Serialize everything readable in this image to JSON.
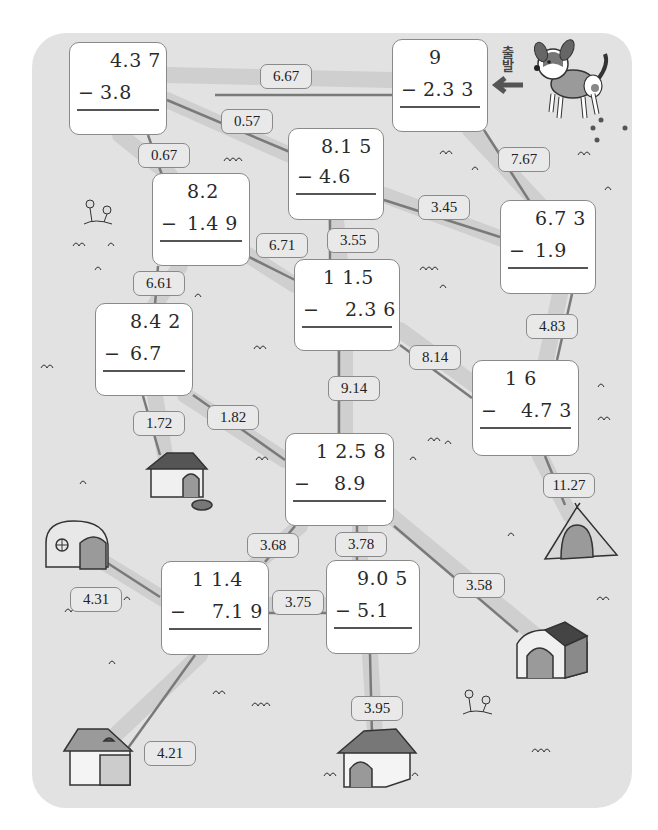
{
  "start_label": "출발",
  "problems": [
    {
      "id": "p1",
      "minuend": "4.3 7",
      "subtrahend": "3.8",
      "x": 69,
      "y": 42,
      "w": 98,
      "h": 93,
      "mx": 8,
      "my": 42,
      "ax": 40,
      "ay": 6,
      "bx": 30,
      "by": 38
    },
    {
      "id": "p2",
      "minuend": "9",
      "subtrahend": "2.3 3",
      "x": 392,
      "y": 39,
      "w": 96,
      "h": 93,
      "mx": 8,
      "my": 42,
      "ax": 36,
      "ay": 6,
      "bx": 30,
      "by": 38
    },
    {
      "id": "p3",
      "minuend": "8.1 5",
      "subtrahend": "4.6",
      "x": 288,
      "y": 128,
      "w": 96,
      "h": 92,
      "mx": 8,
      "my": 38,
      "ax": 32,
      "ay": 6,
      "bx": 30,
      "by": 36
    },
    {
      "id": "p4",
      "minuend": "8.2",
      "subtrahend": "1.4 9",
      "x": 152,
      "y": 173,
      "w": 98,
      "h": 93,
      "mx": 8,
      "my": 42,
      "ax": 34,
      "ay": 6,
      "bx": 34,
      "by": 38
    },
    {
      "id": "p5",
      "minuend": "6.7 3",
      "subtrahend": "1.9",
      "x": 500,
      "y": 200,
      "w": 96,
      "h": 94,
      "mx": 8,
      "my": 42,
      "ax": 34,
      "ay": 6,
      "bx": 34,
      "by": 38
    },
    {
      "id": "p6",
      "minuend": "1 1.5",
      "subtrahend": "2.3 6",
      "x": 294,
      "y": 259,
      "w": 106,
      "h": 92,
      "mx": 8,
      "my": 38,
      "ax": 28,
      "ay": 6,
      "bx": 50,
      "by": 38
    },
    {
      "id": "p7",
      "minuend": "8.4 2",
      "subtrahend": "6.7",
      "x": 95,
      "y": 303,
      "w": 98,
      "h": 93,
      "mx": 8,
      "my": 42,
      "ax": 34,
      "ay": 6,
      "bx": 34,
      "by": 38
    },
    {
      "id": "p8",
      "minuend": "1 6",
      "subtrahend": "4.7 3",
      "x": 472,
      "y": 360,
      "w": 107,
      "h": 96,
      "mx": 8,
      "my": 42,
      "ax": 32,
      "ay": 6,
      "bx": 48,
      "by": 38
    },
    {
      "id": "p9",
      "minuend": "1 2.5 8",
      "subtrahend": "8.9",
      "x": 285,
      "y": 433,
      "w": 109,
      "h": 93,
      "mx": 8,
      "my": 42,
      "ax": 30,
      "ay": 6,
      "bx": 48,
      "by": 38
    },
    {
      "id": "p10",
      "minuend": "1 1.4",
      "subtrahend": "7.1 9",
      "x": 161,
      "y": 561,
      "w": 108,
      "h": 94,
      "mx": 8,
      "my": 42,
      "ax": 30,
      "ay": 6,
      "bx": 50,
      "by": 38
    },
    {
      "id": "p11",
      "minuend": "9.0 5",
      "subtrahend": "5.1",
      "x": 326,
      "y": 560,
      "w": 94,
      "h": 94,
      "mx": 8,
      "my": 42,
      "ax": 30,
      "ay": 6,
      "bx": 30,
      "by": 38
    }
  ],
  "answer_labels": [
    {
      "text": "6.67",
      "x": 260,
      "y": 64,
      "w": 52
    },
    {
      "text": "0.57",
      "x": 221,
      "y": 109,
      "w": 52
    },
    {
      "text": "0.67",
      "x": 138,
      "y": 143,
      "w": 52
    },
    {
      "text": "7.67",
      "x": 498,
      "y": 147,
      "w": 52
    },
    {
      "text": "3.45",
      "x": 418,
      "y": 195,
      "w": 52
    },
    {
      "text": "6.71",
      "x": 256,
      "y": 233,
      "w": 52
    },
    {
      "text": "3.55",
      "x": 327,
      "y": 228,
      "w": 52
    },
    {
      "text": "6.61",
      "x": 133,
      "y": 271,
      "w": 52
    },
    {
      "text": "4.83",
      "x": 526,
      "y": 314,
      "w": 52
    },
    {
      "text": "8.14",
      "x": 409,
      "y": 345,
      "w": 52
    },
    {
      "text": "9.14",
      "x": 328,
      "y": 376,
      "w": 52
    },
    {
      "text": "1.72",
      "x": 133,
      "y": 411,
      "w": 52
    },
    {
      "text": "1.82",
      "x": 207,
      "y": 405,
      "w": 52
    },
    {
      "text": "11.27",
      "x": 543,
      "y": 473,
      "w": 52
    },
    {
      "text": "3.68",
      "x": 247,
      "y": 533,
      "w": 52
    },
    {
      "text": "3.78",
      "x": 335,
      "y": 532,
      "w": 52
    },
    {
      "text": "3.58",
      "x": 453,
      "y": 573,
      "w": 52
    },
    {
      "text": "4.31",
      "x": 70,
      "y": 587,
      "w": 52
    },
    {
      "text": "3.75",
      "x": 272,
      "y": 590,
      "w": 52
    },
    {
      "text": "3.95",
      "x": 351,
      "y": 696,
      "w": 52
    },
    {
      "text": "4.21",
      "x": 144,
      "y": 741,
      "w": 52
    }
  ],
  "destinations": [
    {
      "name": "doghouse-gable",
      "x": 147,
      "y": 449
    },
    {
      "name": "dome-kennel",
      "x": 44,
      "y": 521
    },
    {
      "name": "tent",
      "x": 545,
      "y": 503
    },
    {
      "name": "wooden-doghouse",
      "x": 515,
      "y": 620
    },
    {
      "name": "canopy-bed-house",
      "x": 64,
      "y": 729
    },
    {
      "name": "shingle-doghouse",
      "x": 338,
      "y": 729
    }
  ],
  "colors": {
    "board": "#e2e2e2",
    "path": "#cfcfcf",
    "path_edge": "#7a7a7a",
    "card_border": "#8a8a8a",
    "label_bg": "#e9e9e9"
  }
}
